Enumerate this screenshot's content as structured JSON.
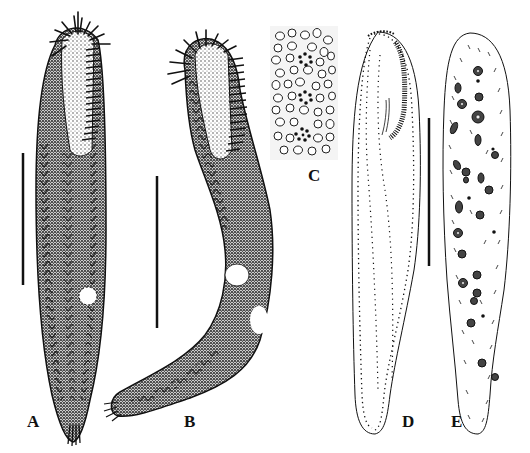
{
  "figure": {
    "panels": [
      {
        "id": "A",
        "label": "A",
        "description": "Ciliate body, ventral view, stippled, with midventral cirral rows in zigzag pattern, adoral zone and contractile vacuole"
      },
      {
        "id": "B",
        "label": "B",
        "description": "Ciliate body, lateral/curved view, stippled, with frontal cirri and contractile vacuole"
      },
      {
        "id": "C",
        "label": "C",
        "description": "Cortical granules pattern with three rosettes"
      },
      {
        "id": "D",
        "label": "D",
        "description": "Outline drawing showing ciliary pattern (kineties, adoral membranelles)"
      },
      {
        "id": "E",
        "label": "E",
        "description": "Outline drawing showing nuclear apparatus (macronuclear nodules) and cirri"
      }
    ],
    "scale_bars": [
      {
        "panel": "A",
        "x": 23,
        "y1": 153,
        "y2": 285
      },
      {
        "panel": "B",
        "x": 157,
        "y1": 176,
        "y2": 328
      },
      {
        "panel": "D-E",
        "x": 429,
        "y1": 118,
        "y2": 266
      }
    ],
    "colors": {
      "ink": "#111111",
      "stipple": "#555555",
      "background": "#ffffff"
    }
  },
  "labels": {
    "a": "A",
    "b": "B",
    "c": "C",
    "d": "D",
    "e": "E"
  }
}
